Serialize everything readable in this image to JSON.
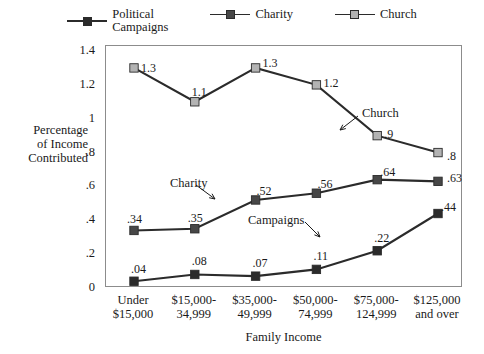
{
  "chart_data": {
    "type": "line",
    "title": "",
    "xlabel": "Family Income",
    "ylabel": "Percentage of Income Contributed",
    "ylim": [
      0,
      1.4
    ],
    "yticks": [
      "0",
      ".2",
      ".4",
      ".6",
      ".8",
      "1",
      "1.2",
      "1.4"
    ],
    "ytick_values": [
      0,
      0.2,
      0.4,
      0.6,
      0.8,
      1.0,
      1.2,
      1.4
    ],
    "grid": false,
    "legend_position": "top",
    "categories": [
      {
        "line1": "Under",
        "line2": "$15,000"
      },
      {
        "line1": "$15,000-",
        "line2": "34,999"
      },
      {
        "line1": "$35,000-",
        "line2": "49,999"
      },
      {
        "line1": "$50,000-",
        "line2": "74,999"
      },
      {
        "line1": "$75,000-",
        "line2": "124,999"
      },
      {
        "line1": "$125,000",
        "line2": "and over"
      }
    ],
    "series": [
      {
        "name": "Political Campaigns",
        "legend_line1": "Political",
        "legend_line2": "Campaigns",
        "marker_color": "#2b2b2b",
        "line_color": "#2b2b2b",
        "values": [
          0.04,
          0.08,
          0.07,
          0.11,
          0.22,
          0.44
        ],
        "labels": [
          ".04",
          ".08",
          ".07",
          ".11",
          ".22",
          ".44"
        ]
      },
      {
        "name": "Charity",
        "legend_line1": "Charity",
        "legend_line2": "",
        "marker_color": "#474747",
        "line_color": "#2b2b2b",
        "values": [
          0.34,
          0.35,
          0.52,
          0.56,
          0.64,
          0.63
        ],
        "labels": [
          ".34",
          ".35",
          ".52",
          ".56",
          ".64",
          ".63"
        ]
      },
      {
        "name": "Church",
        "legend_line1": "Church",
        "legend_line2": "",
        "marker_color": "#b3b3b3",
        "line_color": "#2b2b2b",
        "values": [
          1.3,
          1.1,
          1.3,
          1.2,
          0.9,
          0.8
        ],
        "labels": [
          "1.3",
          "1.1",
          "1.3",
          "1.2",
          ".9",
          ".8"
        ]
      }
    ],
    "annotations": [
      {
        "text": "Church",
        "x": 362,
        "y": 106,
        "arrow": {
          "x1": 358,
          "y1": 116,
          "x2": 340,
          "y2": 130
        }
      },
      {
        "text": "Charity",
        "x": 170,
        "y": 176,
        "arrow": {
          "x1": 196,
          "y1": 185,
          "x2": 215,
          "y2": 199
        }
      },
      {
        "text": "Campaigns",
        "x": 248,
        "y": 213,
        "arrow": {
          "x1": 305,
          "y1": 222,
          "x2": 320,
          "y2": 237
        }
      }
    ],
    "colors": {
      "frame": "#8c8c8c",
      "text": "#1a1a1a",
      "line": "#2b2b2b",
      "campaigns_marker": "#2b2b2b",
      "charity_marker": "#474747",
      "church_marker": "#b3b3b3"
    }
  }
}
